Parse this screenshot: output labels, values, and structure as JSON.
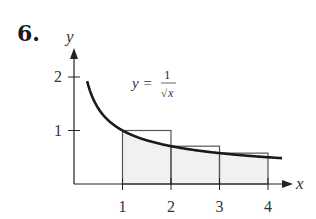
{
  "problem": {
    "number": "6."
  },
  "colors": {
    "curve": "#1a1a1a",
    "axis": "#222222",
    "rect_stroke": "#555555",
    "rect_fill": "#f1f1f1",
    "text": "#333333"
  },
  "labels": {
    "x_axis": "x",
    "y_axis": "y",
    "equation_lhs": "y =",
    "equation_num": "1",
    "equation_den": "x"
  },
  "chart_data": {
    "type": "line",
    "title": "",
    "xlabel": "x",
    "ylabel": "y",
    "xlim": [
      0,
      4.5
    ],
    "ylim": [
      0,
      2.2
    ],
    "x_ticks": [
      1,
      2,
      3,
      4
    ],
    "y_ticks": [
      1,
      2
    ],
    "grid": false,
    "series": [
      {
        "name": "y = 1/sqrt(x)",
        "function": "1/sqrt(x)",
        "domain": [
          0.25,
          4.3
        ]
      }
    ],
    "rectangles": [
      {
        "x0": 1,
        "x1": 2,
        "height": 1.0
      },
      {
        "x0": 2,
        "x1": 3,
        "height": 0.707
      },
      {
        "x0": 3,
        "x1": 4,
        "height": 0.577
      }
    ],
    "shaded_region": {
      "under": "y = 1/sqrt(x)",
      "from": 1,
      "to": 4
    },
    "annotations": [
      {
        "text": "y = 1/√x",
        "position": "above curve near x=1.3"
      }
    ]
  }
}
